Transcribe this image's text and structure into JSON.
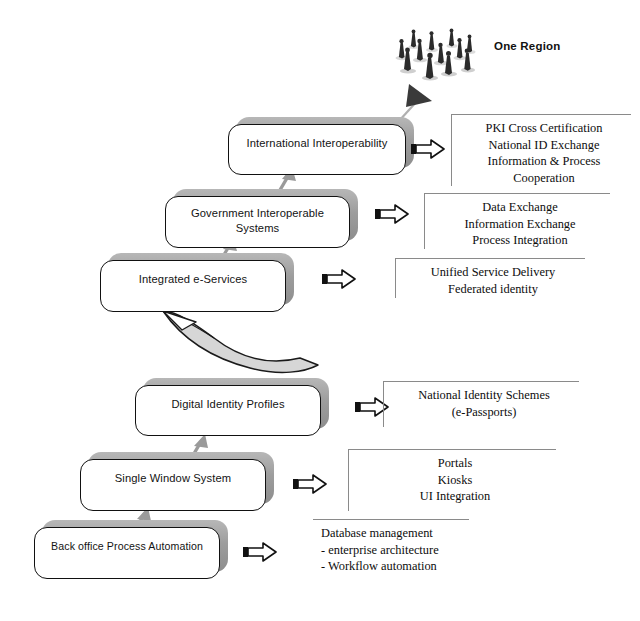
{
  "diagram": {
    "title_caption": "One Region",
    "stages": [
      {
        "id": "international-interoperability",
        "label": "International Interoperability",
        "annotation": "PKI Cross Certification\nNational ID Exchange\nInformation & Process\nCooperation"
      },
      {
        "id": "government-interoperable-systems",
        "label": "Government Interoperable\nSystems",
        "annotation": "Data Exchange\nInformation Exchange\nProcess Integration"
      },
      {
        "id": "integrated-e-services",
        "label": "Integrated e-Services",
        "annotation": "Unified Service Delivery\nFederated identity"
      },
      {
        "id": "digital-identity-profiles",
        "label": "Digital Identity Profiles",
        "annotation": "National Identity Schemes\n(e-Passports)"
      },
      {
        "id": "single-window-system",
        "label": "Single Window System",
        "annotation": "Portals\nKiosks\nUI Integration"
      },
      {
        "id": "back-office-process-automation",
        "label": "Back office Process Automation",
        "annotation": "Database management\n- enterprise architecture\n- Workflow automation"
      }
    ],
    "icons": {
      "people_cluster": "people-group-icon",
      "pointer_arrow": "triangle-pointer-icon",
      "stage_arrows": "right-arrow-outline-icon",
      "progression_arrows": "up-arrow-icon",
      "swoosh_arrow": "curved-swoosh-arrow-icon"
    },
    "colors": {
      "box_border": "#111111",
      "box_shadow": "#9d9d9d",
      "annotation_rule": "#8a8a8a",
      "arrow_grey": "#9a9a9a",
      "text": "#111111"
    }
  }
}
